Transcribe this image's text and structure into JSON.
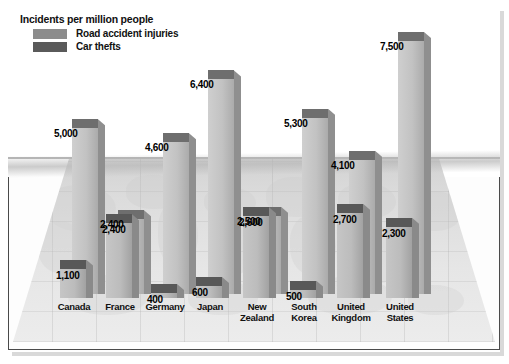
{
  "legend": {
    "title": "Incidents per million people",
    "items": [
      {
        "label": "Road accident injuries",
        "color": "#8c8c8c",
        "key": "road"
      },
      {
        "label": "Car thefts",
        "color": "#5a5a5a",
        "key": "theft"
      }
    ]
  },
  "chart_data": {
    "type": "bar",
    "title": "Incidents per million people",
    "xlabel": "",
    "ylabel": "Incidents per million people",
    "grid": true,
    "legend_position": "top-left",
    "style": "3d-column",
    "ylim": [
      0,
      7500
    ],
    "categories": [
      "Canada",
      "France",
      "Germany",
      "Japan",
      "New Zealand",
      "South Korea",
      "United Kingdom",
      "United States"
    ],
    "series": [
      {
        "name": "Road accident injuries",
        "color": "#8c8c8c",
        "values": [
          5000,
          2400,
          4600,
          6400,
          2500,
          5300,
          4100,
          7500
        ],
        "labels": [
          "5,000",
          "2,400",
          "4,600",
          "6,400",
          "2,500",
          "5,300",
          "4,100",
          "7,500"
        ]
      },
      {
        "name": "Car thefts",
        "color": "#5a5a5a",
        "values": [
          1100,
          2400,
          400,
          600,
          2600,
          500,
          2700,
          2300
        ],
        "labels": [
          "1,100",
          "2,400",
          "400",
          "600",
          "2,600",
          "500",
          "2,700",
          "2,300"
        ]
      }
    ]
  },
  "categories_display": [
    {
      "line1": "Canada",
      "line2": ""
    },
    {
      "line1": "France",
      "line2": ""
    },
    {
      "line1": "Germany",
      "line2": ""
    },
    {
      "line1": "Japan",
      "line2": ""
    },
    {
      "line1": "New",
      "line2": "Zealand"
    },
    {
      "line1": "South",
      "line2": "Korea"
    },
    {
      "line1": "United",
      "line2": "Kingdom"
    },
    {
      "line1": "United",
      "line2": "States"
    }
  ],
  "colors": {
    "bar_front": "#b9b9b9",
    "bar_top_light": "#8c8c8c",
    "bar_top_dark": "#4f4f4f",
    "bar_front_dark": "#a8a8a8",
    "bar_side": "#9a9a9a",
    "floor": "#e3e3e3",
    "frame": "#4a4a4a",
    "text": "#111111"
  }
}
